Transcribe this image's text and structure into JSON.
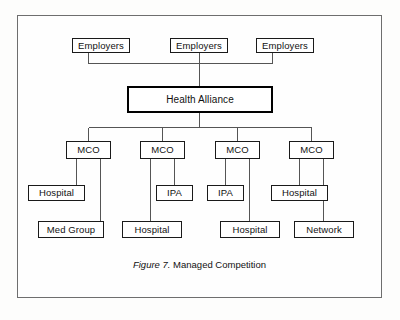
{
  "figure": {
    "caption_label": "Figure 7.",
    "caption_title": "Managed Competition",
    "frame_color": "#6e6e6e",
    "line_color": "#555555",
    "box_border_color": "#1a1a1a",
    "emphasis_border_color": "#000000",
    "background": "#fefefe"
  },
  "nodes": {
    "employer_left": {
      "label": "Employers"
    },
    "employer_center": {
      "label": "Employers"
    },
    "employer_right": {
      "label": "Employers"
    },
    "health_alliance": {
      "label": "Health Alliance"
    },
    "mco_1": {
      "label": "MCO"
    },
    "mco_2": {
      "label": "MCO"
    },
    "mco_3": {
      "label": "MCO"
    },
    "mco_4": {
      "label": "MCO"
    },
    "mco1_child_left": {
      "label": "Hospital"
    },
    "mco1_child_right": {
      "label": "Med Group"
    },
    "mco2_child_left": {
      "label": "Hospital"
    },
    "mco2_child_right": {
      "label": "IPA"
    },
    "mco3_child_left": {
      "label": "IPA"
    },
    "mco3_child_right": {
      "label": "Hospital"
    },
    "mco4_child_left": {
      "label": "Hospital"
    },
    "mco4_child_right": {
      "label": "Network"
    }
  }
}
